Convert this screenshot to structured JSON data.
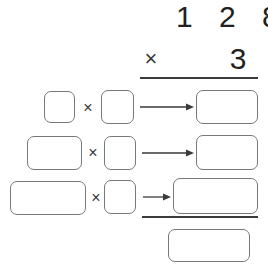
{
  "problem": {
    "multiplicand": "1 2 8",
    "operator": "×",
    "multiplier": "3"
  },
  "colors": {
    "ink": "#231f20",
    "rule": "#3a3a3a",
    "box_border": "#76787b",
    "background": "#ffffff"
  },
  "partial_product_rows": [
    {
      "factor_a": "",
      "times_symbol": "×",
      "factor_b": "",
      "arrow": "right-arrow",
      "product": ""
    },
    {
      "factor_a": "",
      "times_symbol": "×",
      "factor_b": "",
      "arrow": "right-arrow",
      "product": ""
    },
    {
      "factor_a": "",
      "times_symbol": "×",
      "factor_b": "",
      "arrow": "right-arrow",
      "product": ""
    }
  ],
  "total": {
    "value": ""
  }
}
